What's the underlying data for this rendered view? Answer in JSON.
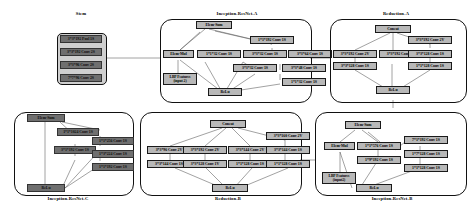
{
  "diagram": {
    "colors": {
      "node_fill": "#b8b8b8",
      "node_dark_fill": "#6f6f6f",
      "border": "#1a1a1a",
      "module_border": "#111111",
      "background": "#ffffff",
      "wire": "#555555"
    }
  },
  "modules": {
    "stem": {
      "title": "Stem",
      "nodes": [
        {
          "label": "3*3*192 Pool 1S"
        },
        {
          "label": "3*3*192 Conv 2S"
        },
        {
          "label": "3*3*96 Conv 2S"
        },
        {
          "label": "7*7*96 Conv 2S"
        }
      ]
    },
    "inception_resnet_a": {
      "title": "Inception-ResNet-A",
      "nodes": {
        "elem_sum": "Elem-Sum",
        "elem_mul": "Elem-Mul",
        "lbp_line1": "LBP Features",
        "lbp_line2": "(input 2)",
        "relu": "ReLu",
        "conv_1x1x192": "1*1*192 Conv 1S",
        "conv_1x1x32_a": "1*1*32 Conv 1S",
        "conv_3x3x32_a": "3*3*32 Conv 1S",
        "conv_3x3x64": "3*3*64 Conv 1S",
        "conv_3x3x32_b": "3*3*32 Conv 1S",
        "conv_3x3x48": "3*3*48 Conv 1S",
        "conv_1x1x32_b": "1*1*32 Conv 1S"
      }
    },
    "reduction_a": {
      "title": "Reduction-A",
      "nodes": {
        "concat": "Concat",
        "relu": "ReLu",
        "conv_3x3x192_left": "3*3*192 Conv 2V",
        "conv_3x3x128_left": "3*3*128 Conv 1S",
        "conv_3x3x192_mid": "3*3*192 Conv 2V",
        "conv_3x3x192_right": "3*3*192 Conv 2V",
        "conv_3x3x128_right": "3*3*128 Conv 1S",
        "conv_1x1x128_right": "1*1*128 Conv 1S"
      }
    },
    "inception_resnet_c": {
      "title": "Inception-ResNet-C",
      "nodes": {
        "elem_sum": "Elem-Sum",
        "relu": "ReLu",
        "conv_1x1x1024": "1*1*1024 Conv 1S",
        "conv_3x1x192": "3*1*192 Conv 1S",
        "conv_1x1x256": "1*1*256 Conv 1S",
        "conv_1x3x224": "1*3*224 Conv 1S",
        "conv_1x1x192": "1*1*192 Conv 1S"
      }
    },
    "reduction_b": {
      "title": "Reduction-B",
      "nodes": {
        "concat": "Concat",
        "relu": "ReLu",
        "conv_3x3x96": "3*3*96 Conv 2V",
        "conv_3x3x144_c1": "3*3*144 Conv 1S",
        "conv_3x3x192": "3*3*192 Conv 2V",
        "conv_3x3x128_c2": "3*3*128 Conv 1V",
        "conv_3x3x144_c3": "3*3*144 Conv 2V",
        "conv_1x1x128_c3": "1*1*128 Conv 1S",
        "conv_3x3x160": "3*3*160 Conv 2V",
        "conv_3x3x144_c4": "3*3*144 Conv 1S",
        "conv_1x1x128_c4": "1*1*128 Conv 1S"
      }
    },
    "inception_resnet_b": {
      "title": "Inception-ResNet-B",
      "nodes": {
        "elem_sum": "Elem-Sum",
        "elem_mul": "Elem-Mul",
        "lbp_line1": "LBP Features",
        "lbp_line2": "(input2)",
        "relu": "ReLu",
        "conv_1x1x576": "1*1*576 Conv 1S",
        "conv_1x9x192": "1*9*192 Conv 1S",
        "conv_7x1x192": "7*1*192 Conv 1S",
        "conv_1x7x128": "1*7*128 Conv 1S",
        "conv_1x1x128": "1*1*128 Conv 1S"
      }
    }
  }
}
